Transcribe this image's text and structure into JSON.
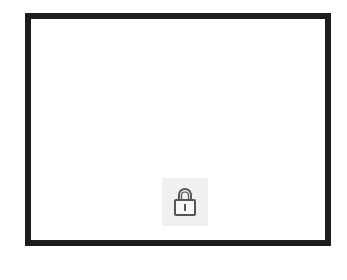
{
  "window": {
    "border_color": "#1c1c1c",
    "background": "#ffffff"
  },
  "lock_button": {
    "icon": "lock-icon",
    "state": "locked",
    "background": "#f0f0f0",
    "icon_color": "#555555"
  }
}
